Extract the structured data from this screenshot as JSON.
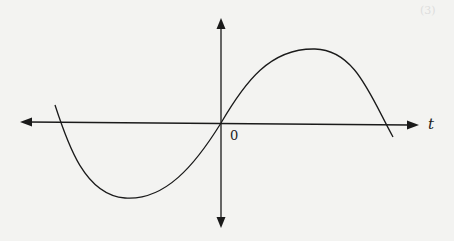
{
  "diagram": {
    "type": "function-plot",
    "axes": {
      "horizontal_label": "t",
      "origin_label": "0",
      "horizontal_arrows": "both",
      "vertical_arrows": "both"
    },
    "curve": {
      "shape": "sine-like",
      "passes_through_origin": true,
      "points_px": [
        [
          55,
          105
        ],
        [
          61,
          123
        ],
        [
          125,
          198
        ],
        [
          221,
          123
        ],
        [
          315,
          49
        ],
        [
          385,
          125
        ],
        [
          393,
          137
        ]
      ]
    },
    "colors": {
      "stroke": "#1a1a1a",
      "background": "#f3f3f1"
    }
  },
  "page_mark": "(3)"
}
